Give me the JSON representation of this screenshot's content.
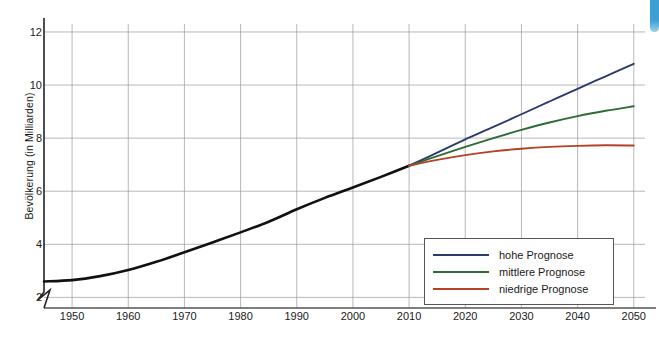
{
  "chart_data": {
    "type": "line",
    "title": "",
    "xlabel": "",
    "ylabel": "Bevölkerung (in Milliarden)",
    "xlim": [
      1945,
      2052
    ],
    "ylim": [
      1.6,
      12.3
    ],
    "yticks": [
      2,
      4,
      6,
      8,
      10,
      12
    ],
    "xticks": [
      1950,
      1960,
      1970,
      1980,
      1990,
      2000,
      2010,
      2020,
      2030,
      2040,
      2050
    ],
    "grid": true,
    "axis_break": true,
    "legend_position": "inside-bottom-right",
    "series": [
      {
        "name": "Historisch",
        "color": "#111111",
        "in_legend": false,
        "x": [
          1945,
          1950,
          1955,
          1960,
          1965,
          1970,
          1975,
          1980,
          1985,
          1990,
          1995,
          2000,
          2005,
          2010
        ],
        "values": [
          2.6,
          2.65,
          2.8,
          3.03,
          3.34,
          3.7,
          4.07,
          4.45,
          4.85,
          5.32,
          5.75,
          6.14,
          6.54,
          6.96
        ]
      },
      {
        "name": "hohe Prognose",
        "color": "#2d3a6e",
        "in_legend": true,
        "x": [
          2010,
          2015,
          2020,
          2025,
          2030,
          2035,
          2040,
          2045,
          2050
        ],
        "values": [
          6.96,
          7.45,
          7.95,
          8.42,
          8.9,
          9.38,
          9.86,
          10.33,
          10.8
        ]
      },
      {
        "name": "mittlere Prognose",
        "color": "#2e6b35",
        "in_legend": true,
        "x": [
          2010,
          2015,
          2020,
          2025,
          2030,
          2035,
          2040,
          2045,
          2050
        ],
        "values": [
          6.96,
          7.32,
          7.67,
          8.0,
          8.31,
          8.59,
          8.83,
          9.03,
          9.2
        ]
      },
      {
        "name": "niedrige Prognose",
        "color": "#b34228",
        "in_legend": true,
        "x": [
          2010,
          2015,
          2020,
          2025,
          2030,
          2035,
          2040,
          2045,
          2050
        ],
        "values": [
          6.96,
          7.18,
          7.36,
          7.5,
          7.6,
          7.67,
          7.71,
          7.73,
          7.72
        ]
      }
    ]
  },
  "legend": {
    "items": [
      {
        "label": "hohe Prognose",
        "color": "#2d3a6e"
      },
      {
        "label": "mittlere Prognose",
        "color": "#2e6b35"
      },
      {
        "label": "niedrige Prognose",
        "color": "#b34228"
      }
    ]
  },
  "axes": {
    "y_title": "Bevölkerung (in Milliarden)",
    "y_tick_labels": [
      "12",
      "10",
      "8",
      "6",
      "4",
      "2"
    ],
    "x_tick_labels": [
      "1950",
      "1960",
      "1970",
      "1980",
      "1990",
      "2000",
      "2010",
      "2020",
      "2030",
      "2040",
      "2050"
    ]
  }
}
